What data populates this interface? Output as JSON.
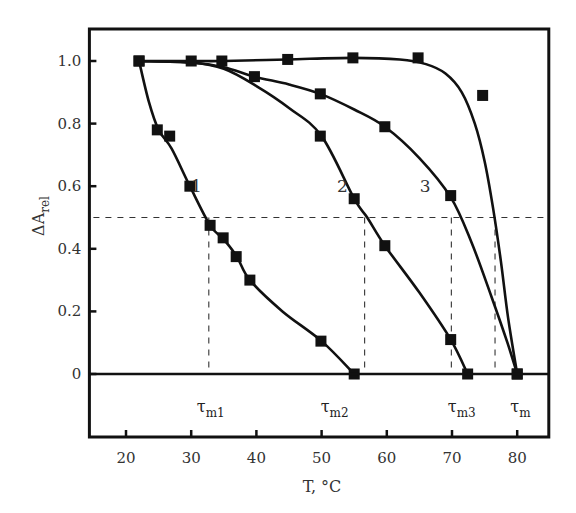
{
  "chart_data": {
    "type": "line",
    "title": "",
    "xlabel": "T, °C",
    "ylabel": "ΔA",
    "ylabel_sub": "rel",
    "xlim": [
      15,
      85
    ],
    "ylim": [
      -0.2,
      1.1
    ],
    "x_ticks": [
      20,
      30,
      40,
      50,
      60,
      70,
      80
    ],
    "y_ticks": [
      0,
      0.2,
      0.4,
      0.6,
      0.8,
      1.0
    ],
    "y_tick_labels": [
      "0",
      "0.2",
      "0.4",
      "0.6",
      "0.8",
      "1.0"
    ],
    "grid": false,
    "legend": "none",
    "zero_line": 0,
    "half_line": 0.5,
    "series": [
      {
        "name": "1",
        "label_pos": [
          30.8,
          0.6
        ],
        "curve": [
          [
            22,
            1.0
          ],
          [
            23.5,
            0.87
          ],
          [
            25,
            0.78
          ],
          [
            27,
            0.72
          ],
          [
            29.8,
            0.6
          ],
          [
            32.9,
            0.475
          ],
          [
            35,
            0.43
          ],
          [
            37,
            0.375
          ],
          [
            39,
            0.3
          ],
          [
            44,
            0.2
          ],
          [
            50,
            0.105
          ],
          [
            55,
            0.0
          ]
        ],
        "points": [
          [
            22,
            1.0
          ],
          [
            24.8,
            0.78
          ],
          [
            26.7,
            0.76
          ],
          [
            29.8,
            0.6
          ],
          [
            32.9,
            0.475
          ],
          [
            34.9,
            0.435
          ],
          [
            36.9,
            0.375
          ],
          [
            39,
            0.3
          ],
          [
            49.9,
            0.105
          ],
          [
            55,
            0.0
          ]
        ]
      },
      {
        "name": "2",
        "label_pos": [
          53.2,
          0.6
        ],
        "curve": [
          [
            22,
            1.0
          ],
          [
            30,
            0.995
          ],
          [
            35,
            0.975
          ],
          [
            40,
            0.92
          ],
          [
            45,
            0.85
          ],
          [
            50,
            0.76
          ],
          [
            55,
            0.56
          ],
          [
            57,
            0.5
          ],
          [
            59.7,
            0.41
          ],
          [
            65,
            0.26
          ],
          [
            69.8,
            0.11
          ],
          [
            72.4,
            0.0
          ]
        ],
        "points": [
          [
            49.8,
            0.76
          ],
          [
            55,
            0.56
          ],
          [
            59.7,
            0.41
          ],
          [
            69.8,
            0.11
          ],
          [
            72.4,
            0.0
          ]
        ]
      },
      {
        "name": "3",
        "label_pos": [
          65.9,
          0.6
        ],
        "curve": [
          [
            22,
            1.0
          ],
          [
            30,
            0.995
          ],
          [
            35,
            0.98
          ],
          [
            39.7,
            0.95
          ],
          [
            45,
            0.925
          ],
          [
            49.8,
            0.895
          ],
          [
            55,
            0.845
          ],
          [
            59.7,
            0.79
          ],
          [
            65,
            0.69
          ],
          [
            69.8,
            0.565
          ],
          [
            73,
            0.42
          ],
          [
            76,
            0.25
          ],
          [
            78.5,
            0.1
          ],
          [
            80,
            0.0
          ]
        ],
        "points": [
          [
            39.7,
            0.95
          ],
          [
            49.8,
            0.895
          ],
          [
            59.7,
            0.79
          ],
          [
            69.8,
            0.57
          ],
          [
            80,
            0.0
          ]
        ]
      },
      {
        "name": "τm",
        "label_pos": null,
        "curve": [
          [
            22,
            1.0
          ],
          [
            30,
            1.0
          ],
          [
            35,
            1.0
          ],
          [
            44.8,
            1.005
          ],
          [
            54.8,
            1.01
          ],
          [
            62,
            1.005
          ],
          [
            66,
            0.99
          ],
          [
            69,
            0.96
          ],
          [
            71.5,
            0.9
          ],
          [
            73.5,
            0.8
          ],
          [
            75,
            0.68
          ],
          [
            76.3,
            0.53
          ],
          [
            77.5,
            0.36
          ],
          [
            78.6,
            0.18
          ],
          [
            80,
            0.0
          ]
        ],
        "points": [
          [
            22,
            1.0
          ],
          [
            30,
            1.0
          ],
          [
            34.7,
            1.0
          ],
          [
            44.8,
            1.005
          ],
          [
            54.8,
            1.01
          ],
          [
            64.8,
            1.01
          ],
          [
            74.7,
            0.89
          ],
          [
            80,
            0.0
          ]
        ]
      }
    ],
    "midpoints": [
      {
        "name": "τm1",
        "main": "τ",
        "sub": "m1",
        "T": 32.7
      },
      {
        "name": "τm2",
        "main": "τ",
        "sub": "m2",
        "T": 56.6
      },
      {
        "name": "τm3",
        "main": "τ",
        "sub": "m3",
        "T": 69.9
      },
      {
        "name": "τm",
        "main": "τ",
        "sub": "m",
        "T": 76.6
      }
    ],
    "tau_label_T": [
      33,
      52,
      71.5,
      80.5
    ],
    "colors": {
      "line": "#111111",
      "marker": "#111111",
      "frame": "#111111",
      "dash": "#333333",
      "background": "#ffffff"
    }
  }
}
